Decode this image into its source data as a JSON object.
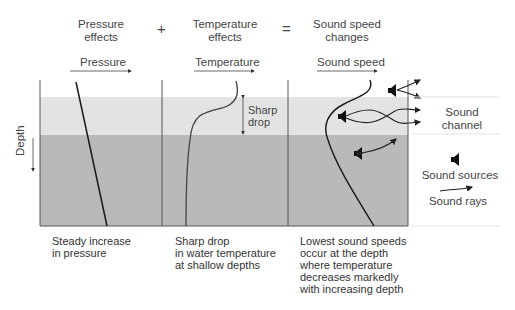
{
  "headers": {
    "pressure": "Pressure\neffects",
    "plus": "+",
    "temperature": "Temperature\neffects",
    "equals": "=",
    "sound_speed": "Sound speed\nchanges"
  },
  "axes": {
    "pressure": "Pressure",
    "temperature": "Temperature",
    "sound_speed": "Sound speed",
    "depth": "Depth"
  },
  "annotations": {
    "sharp_drop": "Sharp\ndrop"
  },
  "legend": {
    "sound_channel": "Sound\nchannel",
    "sound_sources": "Sound sources",
    "sound_rays": "Sound rays"
  },
  "captions": {
    "pressure": "Steady increase\nin pressure",
    "temperature": "Sharp drop\nin water temperature\nat shallow depths",
    "sound_speed": "Lowest sound speeds\noccur at the depth\nwhere temperature\ndecreases markedly\nwith increasing depth"
  },
  "colors": {
    "light_band": "#e3e3e3",
    "dark_band": "#b9b9b9",
    "line": "#1a1a1a",
    "panel_border": "#555555"
  }
}
